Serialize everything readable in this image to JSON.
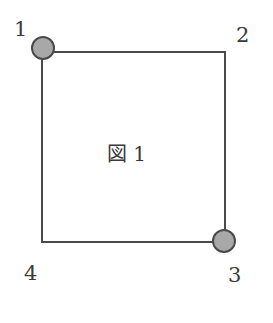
{
  "figure": {
    "title": "図 1",
    "colors": {
      "stroke": "#4a4a4a",
      "node_fill": "#a8a8a8",
      "text": "#3a3a3a",
      "background": "#ffffff"
    },
    "square": {
      "left": 42,
      "top": 52,
      "right": 225,
      "bottom": 242
    },
    "corners": [
      {
        "id": "1",
        "label": "1",
        "marked": true
      },
      {
        "id": "2",
        "label": "2",
        "marked": false
      },
      {
        "id": "3",
        "label": "3",
        "marked": true
      },
      {
        "id": "4",
        "label": "4",
        "marked": false
      }
    ]
  }
}
